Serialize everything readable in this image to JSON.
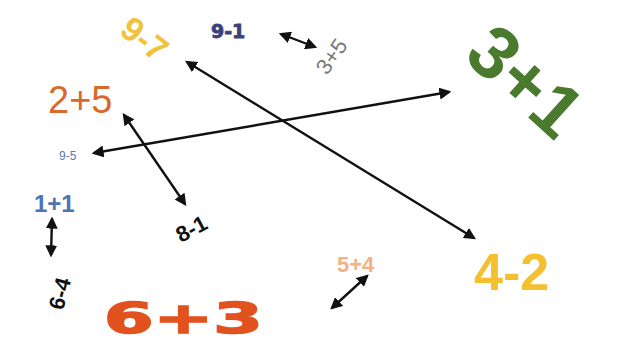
{
  "expressions": {
    "e97": {
      "label": "9-7",
      "value": 2,
      "color": "#f2c23a"
    },
    "e91": {
      "label": "9-1",
      "value": 8,
      "color": "#3b3f7a"
    },
    "e35": {
      "label": "3+5",
      "value": 8,
      "color": "#7a7a7a"
    },
    "e25": {
      "label": "2+5",
      "value": 7,
      "color": "#d9692a"
    },
    "e31": {
      "label": "3+1",
      "value": 4,
      "color": "#4a7a2e"
    },
    "e95": {
      "label": "9-5",
      "value": 4,
      "color": "#5b7bb0"
    },
    "e81": {
      "label": "8-1",
      "value": 7,
      "color": "#111111"
    },
    "e11": {
      "label": "1+1",
      "value": 2,
      "color": "#4f73b3"
    },
    "e64": {
      "label": "6-4",
      "value": 2,
      "color": "#111111"
    },
    "e54": {
      "label": "5+4",
      "value": 9,
      "color": "#f4b183"
    },
    "e42": {
      "label": "4-2",
      "value": 2,
      "color": "#f4c030"
    },
    "e63": {
      "label": "6+3",
      "value": 9,
      "color": "#e2521e"
    }
  },
  "arrows": [
    {
      "from": "9-7",
      "to": "4-2",
      "type": "double"
    },
    {
      "from": "9-1",
      "to": "3+5",
      "type": "double"
    },
    {
      "from": "2+5",
      "to": "8-1",
      "type": "double"
    },
    {
      "from": "9-5",
      "to": "3+1",
      "type": "double"
    },
    {
      "from": "1+1",
      "to": "6-4",
      "type": "double"
    },
    {
      "from": "6+3",
      "to": "5+4",
      "type": "double"
    }
  ],
  "arrow_color": "#111111"
}
